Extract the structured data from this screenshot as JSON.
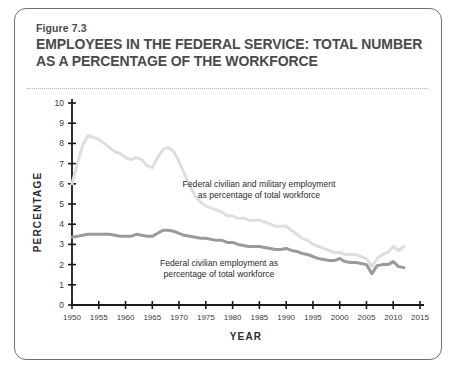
{
  "figure": {
    "label": "Figure 7.3",
    "title_line1": "EMPLOYEES IN THE FEDERAL SERVICE: TOTAL NUMBER",
    "title_line2": "AS A PERCENTAGE OF THE WORKFORCE"
  },
  "colors": {
    "line_total": "#dedede",
    "line_civilian": "#9a9a9a",
    "axis": "#1a1a1a",
    "title_text": "#4a4a4a",
    "frame": "#6e6e6e"
  },
  "annotations": {
    "total_line1": "Federal civilian and military employment",
    "total_line2": "as percentage of total workforce",
    "civilian_line1": "Federal civilian employment as",
    "civilian_line2": "percentage of total workforce"
  },
  "chart_data": {
    "type": "line",
    "title": "EMPLOYEES IN THE FEDERAL SERVICE: TOTAL NUMBER AS A PERCENTAGE OF THE WORKFORCE",
    "xlabel": "YEAR",
    "ylabel": "PERCENTAGE",
    "xlim": [
      1950,
      2015
    ],
    "ylim": [
      0,
      10
    ],
    "xticks": [
      1950,
      1955,
      1960,
      1965,
      1970,
      1975,
      1980,
      1985,
      1990,
      1995,
      2000,
      2005,
      2010,
      2015
    ],
    "yticks": [
      0,
      1,
      2,
      3,
      4,
      5,
      6,
      7,
      8,
      9,
      10
    ],
    "grid": false,
    "legend": "annotations-inline",
    "series": [
      {
        "name": "Federal civilian and military employment as percentage of total workforce",
        "color": "#dedede",
        "x": [
          1950,
          1951,
          1952,
          1953,
          1954,
          1955,
          1956,
          1957,
          1958,
          1959,
          1960,
          1961,
          1962,
          1963,
          1964,
          1965,
          1966,
          1967,
          1968,
          1969,
          1970,
          1971,
          1972,
          1973,
          1974,
          1975,
          1976,
          1977,
          1978,
          1979,
          1980,
          1981,
          1982,
          1983,
          1984,
          1985,
          1986,
          1987,
          1988,
          1989,
          1990,
          1991,
          1992,
          1993,
          1994,
          1995,
          1996,
          1997,
          1998,
          1999,
          2000,
          2001,
          2002,
          2003,
          2004,
          2005,
          2006,
          2007,
          2008,
          2009,
          2010,
          2011,
          2012
        ],
        "y": [
          6.0,
          7.0,
          7.9,
          8.4,
          8.3,
          8.2,
          8.0,
          7.8,
          7.6,
          7.5,
          7.3,
          7.2,
          7.3,
          7.2,
          6.9,
          6.8,
          7.3,
          7.7,
          7.8,
          7.6,
          7.1,
          6.5,
          5.9,
          5.4,
          5.1,
          4.9,
          4.8,
          4.7,
          4.6,
          4.4,
          4.4,
          4.3,
          4.3,
          4.2,
          4.2,
          4.2,
          4.1,
          4.0,
          3.9,
          3.9,
          3.9,
          3.7,
          3.5,
          3.3,
          3.2,
          3.0,
          2.9,
          2.8,
          2.7,
          2.6,
          2.6,
          2.5,
          2.5,
          2.5,
          2.4,
          2.3,
          1.9,
          2.3,
          2.5,
          2.6,
          2.9,
          2.7,
          2.9
        ],
        "marker": "none",
        "linewidth": 3.0
      },
      {
        "name": "Federal civilian employment as percentage of total workforce",
        "color": "#9a9a9a",
        "x": [
          1950,
          1951,
          1952,
          1953,
          1954,
          1955,
          1956,
          1957,
          1958,
          1959,
          1960,
          1961,
          1962,
          1963,
          1964,
          1965,
          1966,
          1967,
          1968,
          1969,
          1970,
          1971,
          1972,
          1973,
          1974,
          1975,
          1976,
          1977,
          1978,
          1979,
          1980,
          1981,
          1982,
          1983,
          1984,
          1985,
          1986,
          1987,
          1988,
          1989,
          1990,
          1991,
          1992,
          1993,
          1994,
          1995,
          1996,
          1997,
          1998,
          1999,
          2000,
          2001,
          2002,
          2003,
          2004,
          2005,
          2006,
          2007,
          2008,
          2009,
          2010,
          2011,
          2012
        ],
        "y": [
          3.35,
          3.4,
          3.45,
          3.5,
          3.5,
          3.5,
          3.5,
          3.5,
          3.45,
          3.4,
          3.4,
          3.4,
          3.5,
          3.45,
          3.4,
          3.4,
          3.55,
          3.7,
          3.7,
          3.65,
          3.55,
          3.45,
          3.4,
          3.35,
          3.3,
          3.3,
          3.25,
          3.2,
          3.2,
          3.1,
          3.1,
          3.0,
          2.95,
          2.9,
          2.9,
          2.9,
          2.85,
          2.8,
          2.75,
          2.75,
          2.8,
          2.7,
          2.65,
          2.55,
          2.5,
          2.4,
          2.3,
          2.25,
          2.2,
          2.2,
          2.3,
          2.15,
          2.1,
          2.1,
          2.05,
          2.0,
          1.55,
          1.95,
          2.0,
          2.0,
          2.15,
          1.9,
          1.85
        ],
        "marker": "none",
        "linewidth": 3.0
      }
    ]
  }
}
